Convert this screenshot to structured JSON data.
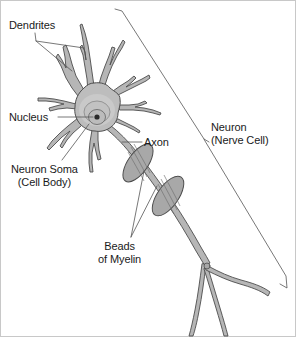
{
  "diagram": {
    "background_color": "#ffffff",
    "border_color": "#c8c8c8",
    "outline_color": "#4d4d4d",
    "cell_fill_color": "#b3b3b3",
    "soma_fill_color": "#bdbdbd",
    "nucleus_halo_color": "#cccccc",
    "nucleus_ring_color": "#9a9a9a",
    "nucleus_dot_color": "#2b2b2b",
    "myelin_fill_color": "#a8a8a8",
    "leader_line_color": "#555555",
    "text_color": "#1a1a1a"
  },
  "labels": {
    "dendrites": "Dendrites",
    "nucleus": "Nucleus",
    "neuron_soma_line1": "Neuron Soma",
    "neuron_soma_line2": "(Cell Body)",
    "axon": "Axon",
    "neuron_line1": "Neuron",
    "neuron_line2": "(Nerve Cell)",
    "beads_line1": "Beads",
    "beads_line2": "of Myelin"
  },
  "parts": [
    {
      "name": "dendrites",
      "label": "Dendrites",
      "count": 9
    },
    {
      "name": "nucleus",
      "label": "Nucleus"
    },
    {
      "name": "neuron-soma",
      "label": "Neuron Soma (Cell Body)"
    },
    {
      "name": "axon",
      "label": "Axon"
    },
    {
      "name": "beads-of-myelin",
      "label": "Beads of Myelin",
      "count": 2
    },
    {
      "name": "axon-terminals",
      "label": "",
      "count": 3
    },
    {
      "name": "neuron-bracket",
      "label": "Neuron (Nerve Cell)"
    }
  ]
}
